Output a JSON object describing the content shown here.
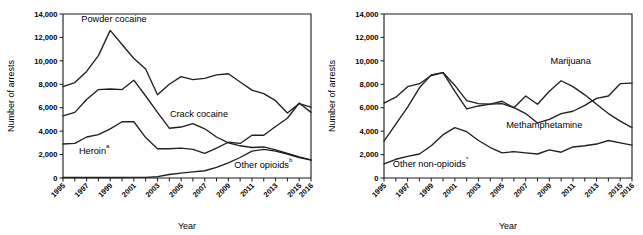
{
  "figure": {
    "panels": [
      "left",
      "right"
    ],
    "background": "#ffffff",
    "colors": {
      "dark": "#231f20",
      "gray": "#808285",
      "axis": "#1a1a1a"
    }
  },
  "chart_data": [
    {
      "type": "line",
      "panel": "left",
      "title": "",
      "xlabel": "Year",
      "ylabel": "Number of arrests",
      "ylim": [
        0,
        14000
      ],
      "ytick_values": [
        0,
        2000,
        4000,
        6000,
        8000,
        10000,
        12000,
        14000
      ],
      "ytick_labels": [
        "0",
        "2,000",
        "4,000",
        "6,000",
        "8,000",
        "10,000",
        "12,000",
        "14,000"
      ],
      "x": [
        1995,
        1996,
        1997,
        1998,
        1999,
        2000,
        2001,
        2002,
        2003,
        2004,
        2005,
        2006,
        2007,
        2008,
        2009,
        2010,
        2011,
        2012,
        2013,
        2014,
        2015,
        2016
      ],
      "xtick_labels": [
        "1995",
        "",
        "1997",
        "",
        "1999",
        "",
        "2001",
        "",
        "2003",
        "",
        "2005",
        "",
        "2007",
        "",
        "2009",
        "",
        "2011",
        "",
        "2013",
        "",
        "2015",
        "2016"
      ],
      "xlim": [
        1995,
        2016
      ],
      "grid": false,
      "legend": "inline-annotations",
      "series": [
        {
          "name": "Powder cocaine",
          "color": "#231f20",
          "label_text": "Powder cocaine",
          "label_sup": "",
          "values": [
            7800,
            8150,
            9100,
            10450,
            12600,
            11400,
            10200,
            9300,
            7100,
            8000,
            8650,
            8400,
            8500,
            8800,
            8900,
            8200,
            7500,
            7200,
            6600,
            5550,
            6350,
            6050
          ]
        },
        {
          "name": "Crack cocaine",
          "color": "#808285",
          "label_text": "Crack cocaine",
          "label_sup": "",
          "values": [
            5300,
            5600,
            6700,
            7550,
            7600,
            7550,
            8350,
            7000,
            5600,
            4250,
            4350,
            4650,
            4200,
            3500,
            3000,
            2750,
            2600,
            2650,
            2400,
            2100,
            1800,
            1550
          ]
        },
        {
          "name": "Heroin",
          "color": "#231f20",
          "label_text": "Heroin",
          "label_sup": "a",
          "values": [
            2900,
            2950,
            3500,
            3700,
            4200,
            4800,
            4800,
            3450,
            2500,
            2500,
            2550,
            2450,
            2100,
            2550,
            3050,
            2950,
            3650,
            3650,
            4400,
            5100,
            6400,
            5600
          ]
        },
        {
          "name": "Other opioids",
          "color": "#808285",
          "label_text": "Other opioids",
          "label_sup": "b",
          "values": [
            40,
            40,
            40,
            40,
            40,
            45,
            50,
            60,
            110,
            300,
            420,
            520,
            620,
            900,
            1300,
            1750,
            2300,
            2450,
            2300,
            2050,
            1750,
            1520
          ]
        }
      ]
    },
    {
      "type": "line",
      "panel": "right",
      "title": "",
      "xlabel": "Year",
      "ylabel": "Number of arrests",
      "ylim": [
        0,
        14000
      ],
      "ytick_values": [
        0,
        2000,
        4000,
        6000,
        8000,
        10000,
        12000,
        14000
      ],
      "ytick_labels": [
        "0",
        "2,000",
        "4,000",
        "6,000",
        "8,000",
        "10,000",
        "12,000",
        "14,000"
      ],
      "x": [
        1995,
        1996,
        1997,
        1998,
        1999,
        2000,
        2001,
        2002,
        2003,
        2004,
        2005,
        2006,
        2007,
        2008,
        2009,
        2010,
        2011,
        2012,
        2013,
        2014,
        2015,
        2016
      ],
      "xtick_labels": [
        "1995",
        "",
        "1997",
        "",
        "1999",
        "",
        "2001",
        "",
        "2003",
        "",
        "2005",
        "",
        "2007",
        "",
        "2009",
        "",
        "2011",
        "",
        "2013",
        "",
        "2015",
        "2016"
      ],
      "xlim": [
        1995,
        2016
      ],
      "grid": false,
      "legend": "inline-annotations",
      "series": [
        {
          "name": "Marijuana",
          "color": "#231f20",
          "label_text": "Marijuana",
          "label_sup": "",
          "values": [
            6400,
            6900,
            7800,
            8050,
            8750,
            9000,
            7400,
            5900,
            6150,
            6300,
            6350,
            6000,
            7000,
            6300,
            7400,
            8300,
            7800,
            7100,
            6300,
            5500,
            4850,
            4300
          ]
        },
        {
          "name": "Methamphetamine",
          "color": "#808285",
          "label_text": "Methamphetamine",
          "label_sup": "",
          "values": [
            3150,
            4600,
            6050,
            7700,
            8800,
            9000,
            7900,
            6600,
            6350,
            6300,
            6550,
            6000,
            5500,
            4700,
            5000,
            5500,
            5700,
            6200,
            6800,
            7000,
            8050,
            8100
          ]
        },
        {
          "name": "Other non-opioids",
          "color": "#231f20",
          "label_text": "Other non-opioids",
          "label_sup": "*",
          "values": [
            1200,
            1600,
            1850,
            2050,
            2750,
            3700,
            4300,
            3950,
            3200,
            2600,
            2150,
            2250,
            2150,
            2050,
            2400,
            2200,
            2650,
            2750,
            2900,
            3200,
            3000,
            2800
          ]
        }
      ]
    }
  ]
}
